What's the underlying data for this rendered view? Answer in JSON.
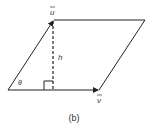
{
  "diagram": {
    "caption": "(b)",
    "labels": {
      "u": "u",
      "v": "v",
      "h": "h",
      "theta": "θ"
    },
    "colors": {
      "line": "#222222",
      "text": "#333333",
      "background": "#ffffff"
    }
  }
}
